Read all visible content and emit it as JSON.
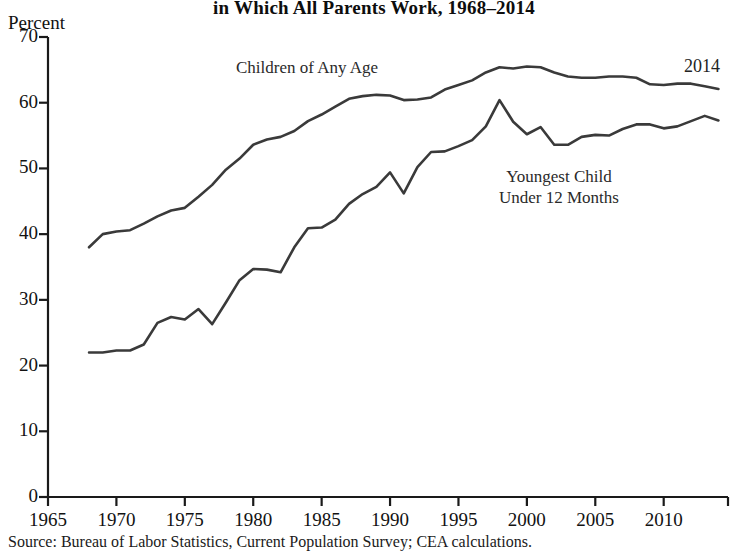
{
  "figure": {
    "title_line1": "Share of Children",
    "title_line2": "in Which All Parents Work, 1968–2014",
    "source": "Source: Bureau of Labor Statistics, Current Population Survey; CEA calculations."
  },
  "annotations": {
    "children_label": "Children of Any Age",
    "youngest_label_line1": "Youngest Child",
    "youngest_label_line2": "Under 12 Months",
    "end_year_label": "2014"
  },
  "chart_data": {
    "type": "line",
    "title": "in Which All Parents Work, 1968–2014",
    "xlabel": "",
    "ylabel": "Percent",
    "xlim": [
      1965,
      2014.7
    ],
    "ylim": [
      0,
      70
    ],
    "yticks": [
      0,
      10,
      20,
      30,
      40,
      50,
      60,
      70
    ],
    "xticks": [
      1965,
      1970,
      1975,
      1980,
      1985,
      1990,
      1995,
      2000,
      2005,
      2010
    ],
    "grid": false,
    "legend_position": "inline-annotations",
    "line_color": "#3a3a3a",
    "axis_color": "#1a1a1a",
    "x": [
      1968,
      1969,
      1970,
      1971,
      1972,
      1973,
      1974,
      1975,
      1976,
      1977,
      1978,
      1979,
      1980,
      1981,
      1982,
      1983,
      1984,
      1985,
      1986,
      1987,
      1988,
      1989,
      1990,
      1991,
      1992,
      1993,
      1994,
      1995,
      1996,
      1997,
      1998,
      1999,
      2000,
      2001,
      2002,
      2003,
      2004,
      2005,
      2006,
      2007,
      2008,
      2009,
      2010,
      2011,
      2012,
      2013,
      2014
    ],
    "series": [
      {
        "name": "Children of Any Age",
        "values": [
          38.0,
          40.0,
          40.4,
          40.6,
          41.6,
          42.7,
          43.6,
          44.0,
          45.7,
          47.5,
          49.8,
          51.5,
          53.6,
          54.4,
          54.8,
          55.7,
          57.2,
          58.2,
          59.4,
          60.6,
          61.0,
          61.2,
          61.1,
          60.4,
          60.5,
          60.8,
          62.0,
          62.7,
          63.4,
          64.6,
          65.4,
          65.2,
          65.5,
          65.4,
          64.6,
          64.0,
          63.8,
          63.8,
          64.0,
          64.0,
          63.8,
          62.8,
          62.7,
          62.9,
          62.9,
          62.5,
          62.1
        ]
      },
      {
        "name": "Youngest Child Under 12 Months",
        "values": [
          22.0,
          22.0,
          22.3,
          22.3,
          23.2,
          26.5,
          27.4,
          27.0,
          28.6,
          26.3,
          29.6,
          33.0,
          34.7,
          34.6,
          34.2,
          38.0,
          40.9,
          41.0,
          42.2,
          44.6,
          46.1,
          47.2,
          49.4,
          46.2,
          50.2,
          52.5,
          52.6,
          53.4,
          54.3,
          56.4,
          60.4,
          57.1,
          55.2,
          56.3,
          53.6,
          53.6,
          54.8,
          55.1,
          55.0,
          56.0,
          56.7,
          56.7,
          56.1,
          56.4,
          57.2,
          58.0,
          57.3
        ]
      }
    ]
  }
}
